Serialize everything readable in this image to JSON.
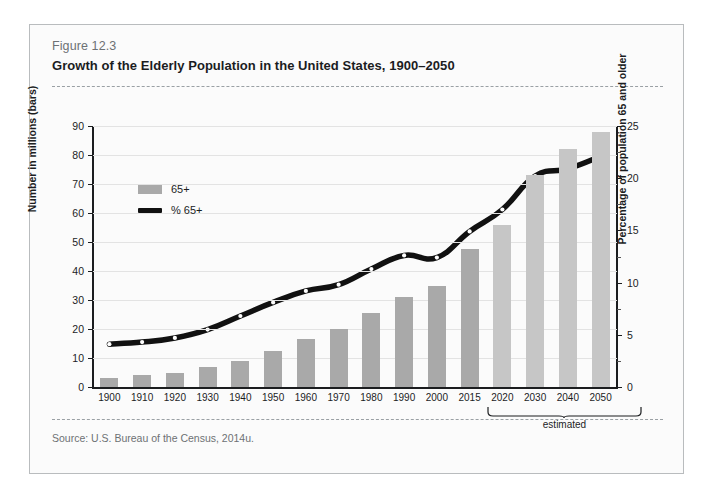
{
  "figure": {
    "number": "Figure 12.3",
    "title": "Growth of the Elderly Population in the United States, 1900–2050",
    "source": "Source:  U.S. Bureau of the Census, 2014u.",
    "estimated_caption": "estimated"
  },
  "legend": {
    "bars_label": "65+",
    "line_label": "% 65+"
  },
  "colors": {
    "bar": "#a9a9a9",
    "bar_estimated": "#c6c6c6",
    "line": "#111111",
    "frame": "#b9bcbe",
    "grid": "#e3e3e3",
    "title": "#1b1d1f",
    "muted": "#6d7174"
  },
  "chart_data": {
    "type": "bar",
    "title": "Growth of the Elderly Population in the United States, 1900–2050",
    "xlabel": "",
    "ylabel": "Number in millions (bars)",
    "y2label": "Percentage of population 65 and older",
    "ylim": [
      0,
      90
    ],
    "y2lim": [
      0,
      25
    ],
    "yticks": [
      0,
      10,
      20,
      30,
      40,
      50,
      60,
      70,
      80,
      90
    ],
    "y2ticks": [
      0,
      5,
      10,
      15,
      20,
      25
    ],
    "grid": true,
    "legend_position": "upper-left",
    "categories": [
      "1900",
      "1910",
      "1920",
      "1930",
      "1940",
      "1950",
      "1960",
      "1970",
      "1980",
      "1990",
      "2000",
      "2015",
      "2020",
      "2030",
      "2040",
      "2050"
    ],
    "estimated_categories": [
      "2020",
      "2030",
      "2040",
      "2050"
    ],
    "series": [
      {
        "name": "65+",
        "type": "bar",
        "axis": "left",
        "unit": "millions",
        "values": [
          3,
          4,
          5,
          7,
          9,
          12.5,
          16.5,
          20,
          25.5,
          31,
          35,
          47.5,
          56,
          73,
          82,
          88
        ]
      },
      {
        "name": "% 65+",
        "type": "line",
        "axis": "right",
        "unit": "percent",
        "values": [
          4.1,
          4.3,
          4.7,
          5.5,
          6.8,
          8.1,
          9.2,
          9.8,
          11.3,
          12.6,
          12.4,
          14.9,
          17.0,
          20.2,
          20.9,
          22.1
        ]
      }
    ]
  }
}
